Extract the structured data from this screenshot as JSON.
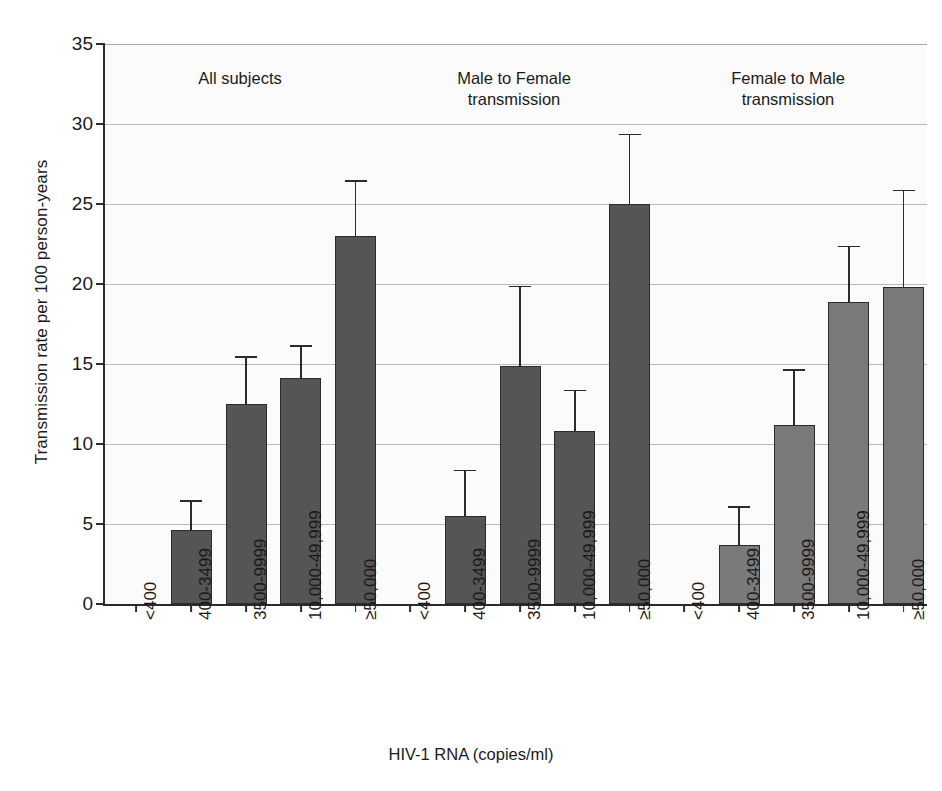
{
  "chart_data": {
    "type": "bar",
    "title": "",
    "xlabel": "HIV-1 RNA (copies/ml)",
    "ylabel": "Transmission rate per 100 person-years",
    "ylim": [
      0,
      35
    ],
    "ytick_step": 5,
    "ytick_labels": [
      "0",
      "5",
      "10",
      "15",
      "20",
      "25",
      "30",
      "35"
    ],
    "grid": "horizontal",
    "legend": "none",
    "categories": [
      "<400",
      "400-3499",
      "3500-9999",
      "10,000-49,999",
      "≥50,000"
    ],
    "groups": [
      {
        "name": "All subjects",
        "heading": "All subjects",
        "color": "#555555",
        "values": [
          0,
          4.6,
          12.5,
          14.1,
          23.0
        ],
        "ci_upper": [
          0,
          6.5,
          15.5,
          16.2,
          26.5
        ]
      },
      {
        "name": "Male to Female transmission",
        "heading": "Male to Female\ntransmission",
        "color": "#555555",
        "values": [
          0,
          5.5,
          14.9,
          10.8,
          25.0
        ],
        "ci_upper": [
          0,
          8.4,
          19.9,
          13.4,
          29.4
        ]
      },
      {
        "name": "Female to Male transmission",
        "heading": "Female to Male\ntransmission",
        "color": "#7a7a7a",
        "values": [
          0,
          3.7,
          11.2,
          18.9,
          19.8
        ],
        "ci_upper": [
          0,
          6.1,
          14.7,
          22.4,
          25.9
        ]
      }
    ]
  },
  "axes": {
    "y_title": "Transmission rate per 100 person-years",
    "x_title": "HIV-1 RNA (copies/ml)"
  }
}
